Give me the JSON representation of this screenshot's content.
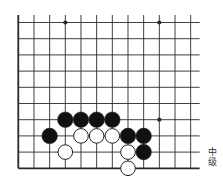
{
  "board": {
    "columns": 12,
    "rows": 10,
    "origin_x": 18.3,
    "origin_y": 22.5,
    "spacing_x": 15.67,
    "spacing_y": 16.2,
    "edges": {
      "left": true,
      "bottom": true,
      "top": false,
      "right": false
    },
    "colors": {
      "line": "#2a2a2a",
      "black_stone": "#111111",
      "white_stone": "#ffffff",
      "stone_outline": "#222222"
    },
    "star_points": [
      {
        "col": 4,
        "row": 1
      },
      {
        "col": 10,
        "row": 1
      },
      {
        "col": 10,
        "row": 7
      }
    ],
    "stones": [
      {
        "color": "black",
        "col": 4,
        "row": 7
      },
      {
        "color": "black",
        "col": 5,
        "row": 7
      },
      {
        "color": "black",
        "col": 6,
        "row": 7
      },
      {
        "color": "black",
        "col": 7,
        "row": 7
      },
      {
        "color": "black",
        "col": 3,
        "row": 8
      },
      {
        "color": "white",
        "col": 5,
        "row": 8
      },
      {
        "color": "white",
        "col": 6,
        "row": 8
      },
      {
        "color": "white",
        "col": 7,
        "row": 8
      },
      {
        "color": "black",
        "col": 8,
        "row": 8
      },
      {
        "color": "black",
        "col": 9,
        "row": 8
      },
      {
        "color": "white",
        "col": 4,
        "row": 9
      },
      {
        "color": "white",
        "col": 8,
        "row": 9
      },
      {
        "color": "black",
        "col": 9,
        "row": 9
      },
      {
        "color": "white",
        "col": 8,
        "row": 10
      }
    ]
  },
  "label": {
    "line1": "中",
    "line2": "级"
  }
}
